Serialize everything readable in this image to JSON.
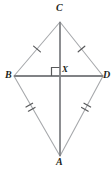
{
  "figure": {
    "background_color": "#ffffff",
    "width": 112,
    "height": 176,
    "vertices": [
      {
        "name": "C",
        "label": "C",
        "x": 60,
        "y": 22,
        "role": "top-vertex"
      },
      {
        "name": "B",
        "label": "B",
        "x": 14,
        "y": 76,
        "role": "left-vertex"
      },
      {
        "name": "D",
        "label": "D",
        "x": 103,
        "y": 76,
        "role": "right-vertex"
      },
      {
        "name": "A",
        "label": "A",
        "x": 60,
        "y": 156,
        "role": "bottom-vertex"
      },
      {
        "name": "X",
        "label": "X",
        "x": 60,
        "y": 76,
        "role": "diagonal-intersection"
      }
    ],
    "edges": [
      {
        "name": "BC",
        "from": "B",
        "to": "C",
        "color": "#a7a9ac",
        "width": 1,
        "ticks": 1
      },
      {
        "name": "CD",
        "from": "C",
        "to": "D",
        "color": "#a7a9ac",
        "width": 1,
        "ticks": 1
      },
      {
        "name": "BA",
        "from": "B",
        "to": "A",
        "color": "#a7a9ac",
        "width": 1,
        "ticks": 2
      },
      {
        "name": "DA",
        "from": "D",
        "to": "A",
        "color": "#a7a9ac",
        "width": 1,
        "ticks": 2
      }
    ],
    "diagonals": [
      {
        "name": "CA",
        "from": "C",
        "to": "A",
        "color": "#808285",
        "width": 2
      },
      {
        "name": "BD",
        "from": "B",
        "to": "D",
        "color": "#808285",
        "width": 2
      }
    ],
    "right_angle": {
      "at": "X",
      "label": "right-angle-marker",
      "color": "#58595b",
      "size": 8,
      "position": "upper-left"
    },
    "tick_marks": {
      "color": "#58595b",
      "length": 6,
      "single_pairs": [
        "BC",
        "CD"
      ],
      "double_pairs": [
        "BA",
        "DA"
      ]
    },
    "label_color": "#231f20"
  }
}
